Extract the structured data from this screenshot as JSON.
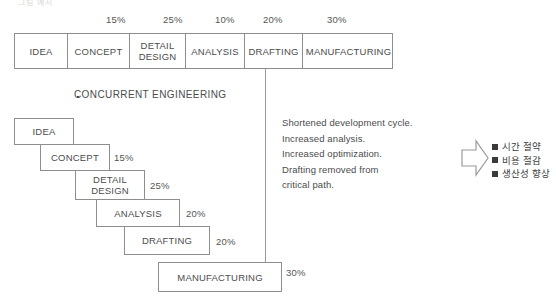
{
  "figure": {
    "clipped_top_text": "그림  예시",
    "concurrent_heading": "CONCURRENT ENGINEERING"
  },
  "sequential": {
    "percent_labels": [
      {
        "text": "15%",
        "x": 106,
        "y": 14
      },
      {
        "text": "25%",
        "x": 163,
        "y": 14
      },
      {
        "text": "10%",
        "x": 215,
        "y": 14
      },
      {
        "text": "20%",
        "x": 263,
        "y": 14
      },
      {
        "text": "30%",
        "x": 327,
        "y": 14
      }
    ],
    "cells": [
      {
        "label": "IDEA",
        "width": 53
      },
      {
        "label": "CONCEPT",
        "width": 62
      },
      {
        "label": "DETAIL\nDESIGN",
        "width": 56
      },
      {
        "label": "ANALYSIS",
        "width": 59
      },
      {
        "label": "DRAFTING",
        "width": 58
      },
      {
        "label": "MANUFACTURING",
        "width": 91
      }
    ]
  },
  "concurrent": {
    "boxes": [
      {
        "label": "IDEA",
        "x": 14,
        "y": 118,
        "w": 60,
        "h": 27,
        "pct": "",
        "pct_x": 0,
        "pct_y": 0
      },
      {
        "label": "CONCEPT",
        "x": 40,
        "y": 144,
        "w": 70,
        "h": 27,
        "pct": "15%",
        "pct_x": 114,
        "pct_y": 152
      },
      {
        "label": "DETAIL\nDESIGN",
        "x": 75,
        "y": 170,
        "w": 70,
        "h": 30,
        "pct": "25%",
        "pct_x": 150,
        "pct_y": 180
      },
      {
        "label": "ANALYSIS",
        "x": 96,
        "y": 199,
        "w": 84,
        "h": 28,
        "pct": "20%",
        "pct_x": 186,
        "pct_y": 208
      },
      {
        "label": "DRAFTING",
        "x": 124,
        "y": 226,
        "w": 86,
        "h": 29,
        "pct": "20%",
        "pct_x": 216,
        "pct_y": 236
      },
      {
        "label": "MANUFACTURING",
        "x": 158,
        "y": 262,
        "w": 124,
        "h": 30,
        "pct": "30%",
        "pct_x": 286,
        "pct_y": 267
      }
    ]
  },
  "benefits": {
    "lines": [
      "Shortened development cycle.",
      "Increased analysis.",
      "Increased optimization.",
      "Drafting removed from",
      "critical path."
    ]
  },
  "outcomes": {
    "items": [
      "시간 절약",
      "비용 절감",
      "생산성 향상"
    ]
  },
  "colors": {
    "stroke": "#8e8e8e",
    "text": "#4b4b4b",
    "bullet": "#3a3a3a"
  }
}
